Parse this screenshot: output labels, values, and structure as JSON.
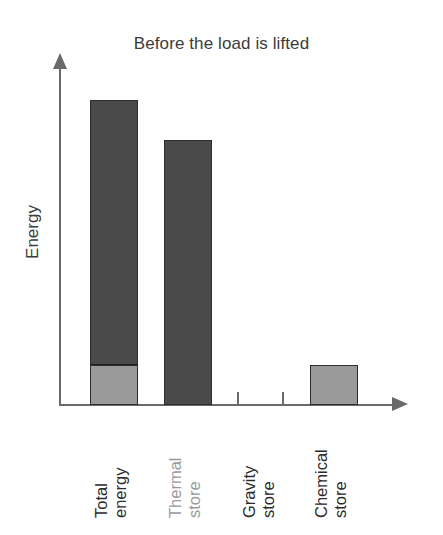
{
  "chart_data": {
    "type": "bar",
    "title": "Before the load is lifted",
    "xlabel": "",
    "ylabel": "Energy",
    "grid": false,
    "legend": "none",
    "axis_arrows": true,
    "y_axis_ticks": false,
    "ylim": [
      0,
      100
    ],
    "categories": [
      "Total energy",
      "Thermal store",
      "Gravity store",
      "Chemical store"
    ],
    "category_lines": [
      [
        "Total",
        "energy"
      ],
      [
        "Thermal",
        "store"
      ],
      [
        "Gravity",
        "store"
      ],
      [
        "Chemical",
        "store"
      ]
    ],
    "values": [
      100,
      87,
      0,
      13
    ],
    "stacked": true,
    "series": [
      {
        "name": "Thermal portion",
        "values": [
          87,
          87,
          0,
          0
        ],
        "color": "#4a4a4a"
      },
      {
        "name": "Chemical portion",
        "values": [
          13,
          0,
          0,
          13
        ],
        "color": "#9a9a9a"
      }
    ],
    "bars": [
      {
        "category": "Total energy",
        "label_color": "#2b2b2b",
        "total": 100,
        "segments": [
          {
            "name": "thermal",
            "value": 87,
            "color": "#4a4a4a"
          },
          {
            "name": "chemical",
            "value": 13,
            "color": "#9a9a9a"
          }
        ]
      },
      {
        "category": "Thermal store",
        "label_color": "#9a9a9a",
        "total": 87,
        "segments": [
          {
            "name": "thermal",
            "value": 87,
            "color": "#4a4a4a"
          }
        ]
      },
      {
        "category": "Gravity store",
        "label_color": "#2b2b2b",
        "total": 0,
        "segments": []
      },
      {
        "category": "Chemical store",
        "label_color": "#2b2b2b",
        "total": 13,
        "segments": [
          {
            "name": "chemical",
            "value": 13,
            "color": "#9a9a9a"
          }
        ]
      }
    ]
  },
  "colors": {
    "dark_gray": "#4a4a4a",
    "light_gray": "#9a9a9a",
    "axis": "#6a6a6a",
    "text": "#2b2b2b",
    "title_text": "#3b3b3b",
    "background": "#ffffff"
  },
  "title": {
    "text": "Before the load is lifted"
  },
  "axes": {
    "y_title": "Energy"
  }
}
